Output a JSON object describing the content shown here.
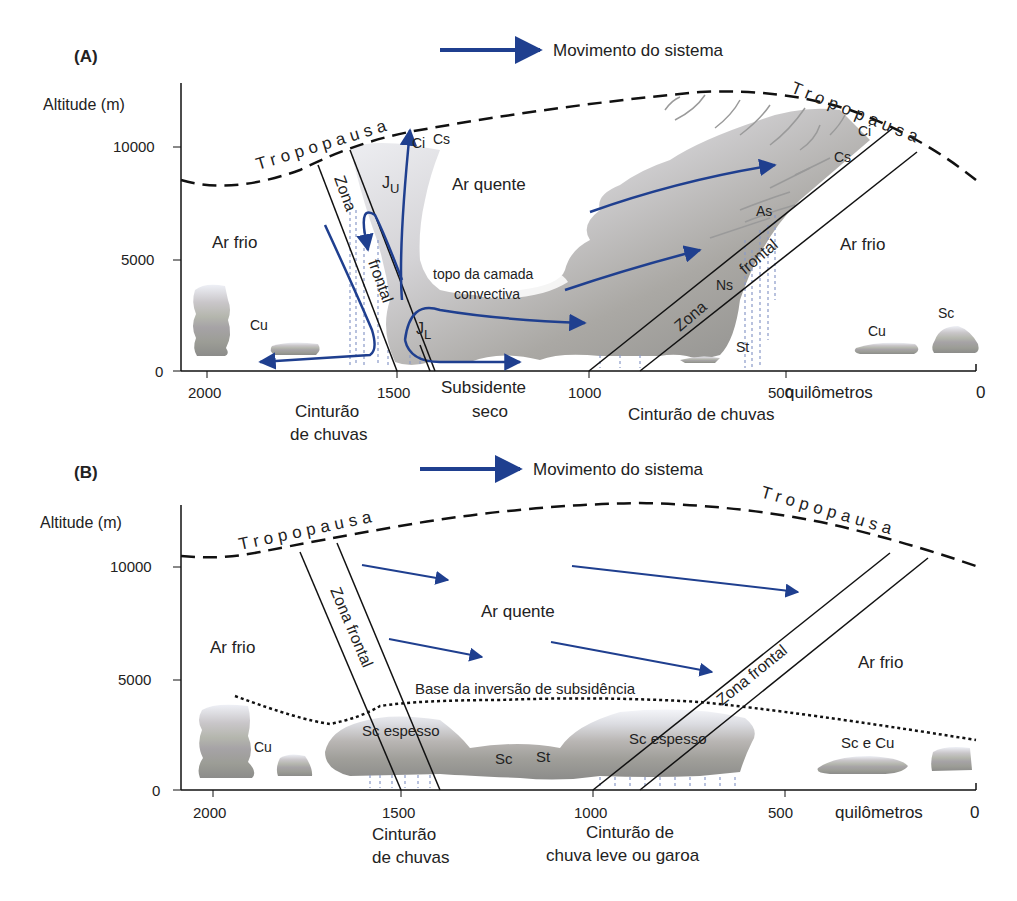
{
  "panel_a": {
    "tag": "(A)",
    "legend": "Movimento do sistema",
    "y_axis_label": "Altitude (m)",
    "y_ticks": [
      "10000",
      "5000",
      "0"
    ],
    "x_ticks": [
      "2000",
      "1500",
      "1000",
      "500",
      "0"
    ],
    "x_unit": "quilômetros",
    "tropopause_left": "Tropopausa",
    "tropopause_right": "Tropopausa",
    "air_cold_left": "Ar frio",
    "air_warm": "Ar quente",
    "air_cold_right": "Ar frio",
    "frontal_zone_left_1": "Zona",
    "frontal_zone_left_2": "frontal",
    "frontal_zone_right_1": "Zona",
    "frontal_zone_right_2": "frontal",
    "jet_upper": "J",
    "jet_upper_sub": "U",
    "jet_lower": "J",
    "jet_lower_sub": "L",
    "convective_top_1": "topo da camada",
    "convective_top_2": "convectiva",
    "clouds": {
      "ci_left": "Ci",
      "cs_left": "Cs",
      "ci_right": "Ci",
      "cs_right": "Cs",
      "as": "As",
      "ns": "Ns",
      "st": "St",
      "cu_left": "Cu",
      "cu_right": "Cu",
      "sc_right": "Sc"
    },
    "below_axis": {
      "rain_belt_left_1": "Cinturão",
      "rain_belt_left_2": "de chuvas",
      "dry_subsiding_1": "Subsidente",
      "dry_subsiding_2": "seco",
      "rain_belt_right": "Cinturão de chuvas"
    }
  },
  "panel_b": {
    "tag": "(B)",
    "legend": "Movimento do sistema",
    "y_axis_label": "Altitude (m)",
    "y_ticks": [
      "10000",
      "5000",
      "0"
    ],
    "x_ticks": [
      "2000",
      "1500",
      "1000",
      "500",
      "0"
    ],
    "x_unit": "quilômetros",
    "tropopause_left": "Tropopausa",
    "tropopause_right": "Tropopausa",
    "air_cold_left": "Ar frio",
    "air_warm": "Ar quente",
    "air_cold_right": "Ar frio",
    "frontal_zone_left": "Zona frontal",
    "frontal_zone_right": "Zona frontal",
    "inversion_label": "Base da inversão de subsidência",
    "clouds": {
      "cu_left": "Cu",
      "sc_thick_left": "Sc espesso",
      "sc": "Sc",
      "st": "St",
      "sc_thick_right": "Sc espesso",
      "sc_cu_right": "Sc e Cu"
    },
    "below_axis": {
      "rain_belt_1": "Cinturão",
      "rain_belt_2": "de chuvas",
      "drizzle_belt_1": "Cinturão de",
      "drizzle_belt_2": "chuva leve ou garoa"
    }
  },
  "colors": {
    "arrow_blue": "#1f3f8f",
    "axis": "#111111",
    "cloud_dark": "#8a8a88",
    "cloud_light": "#e6e8ee",
    "rain": "#8a9ac8"
  }
}
